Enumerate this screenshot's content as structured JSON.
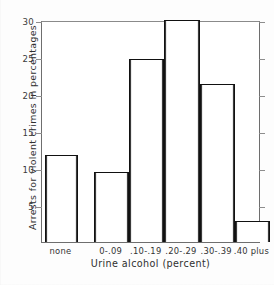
{
  "chart_data": {
    "type": "bar",
    "title": "",
    "xlabel": "Urine alcohol (percent)",
    "ylabel": "Arrests for violent crimes in percentages",
    "categories": [
      "none",
      "0-.09",
      ".10-.19",
      ".20-.29",
      ".30-.39",
      ".40 plus"
    ],
    "values": [
      11.7,
      9.4,
      24.7,
      30.0,
      21.4,
      2.9
    ],
    "ylim": [
      0,
      30
    ],
    "yticks": [
      5,
      10,
      15,
      20,
      25,
      30
    ],
    "ytick_labels": [
      "5",
      "10",
      "15",
      "20",
      "25",
      "30"
    ],
    "grid": false,
    "legend": false,
    "bar_fill_color": "#ffffff",
    "bar_edge_color": "#111111",
    "axis_color": "#6e6e6e"
  }
}
